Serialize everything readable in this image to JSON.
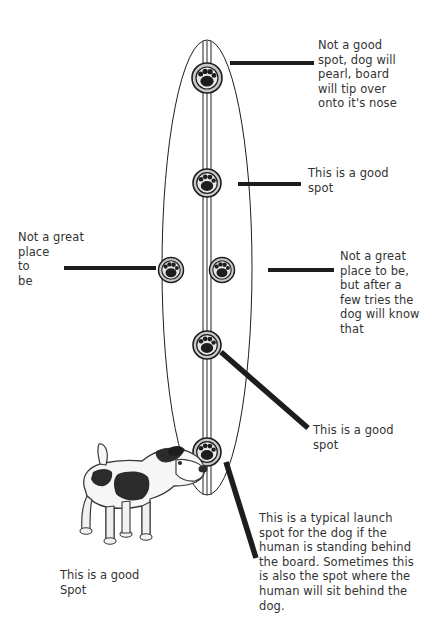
{
  "diagram": {
    "background_color": "#ffffff",
    "ink_color": "#1d1d1d",
    "text_color": "#333333",
    "board": {
      "shape": "ellipse",
      "center_strip": "vertical double line",
      "marker_icon": "paw-print-icon",
      "marker_count": 6
    }
  },
  "notes": {
    "top_right": "Not a good\nspot, dog will\npearl, board\nwill tip over\nonto it's nose",
    "upper_right": "This is a good\nspot",
    "left": "Not a great\nplace\nto\nbe",
    "mid_right": "Not a great\n place to be,\n but after a\nfew tries the\ndog will know\nthat",
    "lower_right": "This is a good\nspot",
    "bottom_right": "This is a typical launch\nspot for the dog if the\nhuman is standing behind\nthe board. Sometimes this\nis also the spot where the\nhuman will sit behind the\ndog.",
    "dog_caption": "This is a good\nSpot"
  }
}
